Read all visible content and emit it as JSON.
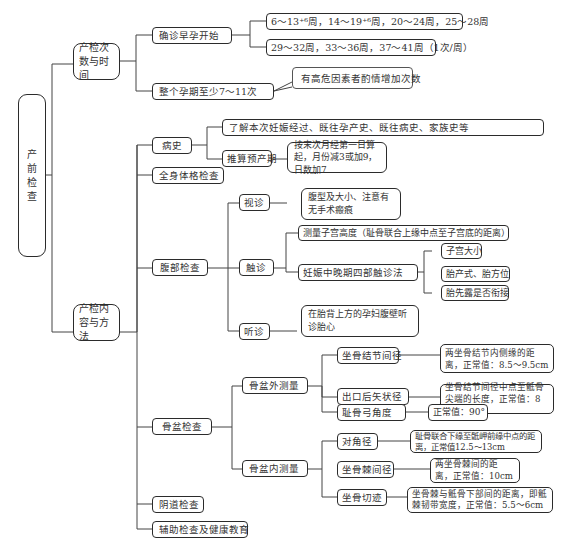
{
  "root": {
    "label": "产前检查",
    "chars": [
      "产",
      "前",
      "检",
      "查"
    ]
  },
  "branch_times": {
    "label": "产检次数与时间",
    "confirm_start": {
      "label": "确诊早孕开始",
      "schedule_1": "6～13⁺⁶周，14～19⁺⁶周，20～24周，25～28周",
      "schedule_2": "29～32周，33～36周，37～41周（1次/周）"
    },
    "total": {
      "label": "整个孕期至少7～11次",
      "note": "有高危因素者酌情增加次数"
    }
  },
  "branch_content": {
    "label": "产检内容与方法",
    "history": {
      "label": "病史",
      "detail": "了解本次妊娠经过、既往孕产史、既往病史、家族史等",
      "due_date": {
        "label": "推算预产期",
        "detail": "按末次月经第一日算起，月份减3或加9，日数加7"
      }
    },
    "physical": {
      "label": "全身体格检查"
    },
    "abdominal": {
      "label": "腹部检查",
      "inspection": {
        "label": "视诊",
        "detail": "腹型及大小、注意有无手术瘢痕"
      },
      "palpation": {
        "label": "触诊",
        "fundal_height": "测量子宫高度（耻骨联合上缘中点至子宫底的距离）",
        "leopold": {
          "label": "妊娠中晚期四部触诊法",
          "items": [
            "子宫大小",
            "胎产式、胎方位",
            "胎先露是否衔接"
          ]
        }
      },
      "auscultation": {
        "label": "听诊",
        "detail": "在胎背上方的孕妇腹壁听诊胎心"
      }
    },
    "pelvic": {
      "label": "骨盆检查",
      "external": {
        "label": "骨盆外测量",
        "items": [
          {
            "label": "坐骨结节间径",
            "detail": "两坐骨结节内侧缘的距离，正常值：8.5～9.5cm"
          },
          {
            "label": "出口后矢状径",
            "detail": "坐骨结节间径中点至骶骨尖端的长度，正常值：8～9cm"
          },
          {
            "label": "耻骨弓角度",
            "detail": "正常值：90°"
          }
        ]
      },
      "internal": {
        "label": "骨盆内测量",
        "items": [
          {
            "label": "对角径",
            "detail": "耻骨联合下缘至骶岬前缘中点的距离，正常值12.5～13cm"
          },
          {
            "label": "坐骨棘间径",
            "detail": "两坐骨棘间的距离，正常值：10cm"
          },
          {
            "label": "坐骨切迹",
            "detail": "坐骨棘与骶骨下部间的距离，即骶棘韧带宽度，正常值：5.5～6cm"
          }
        ]
      }
    },
    "vaginal": {
      "label": "阴道检查"
    },
    "auxiliary": {
      "label": "辅助检查及健康教育"
    }
  }
}
